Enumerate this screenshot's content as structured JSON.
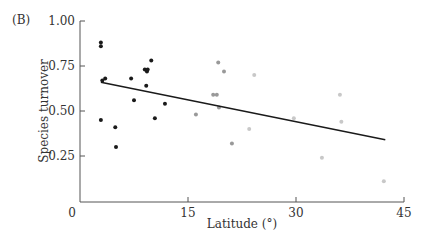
{
  "panel_label": "(B)",
  "chart_data": {
    "type": "scatter",
    "title": "",
    "xlabel": "Latitude (°)",
    "ylabel": "Species turnover",
    "xlim": [
      0,
      45
    ],
    "ylim": [
      0,
      1.0
    ],
    "xticks": [
      "0",
      "15",
      "30",
      "45"
    ],
    "yticks": [
      "0.25",
      "0.50",
      "0.75",
      "1.00"
    ],
    "grid": false,
    "legend": null,
    "series": [
      {
        "name": "tropical",
        "color": "#1a1a1a",
        "points": [
          [
            2.9,
            0.88
          ],
          [
            2.9,
            0.86
          ],
          [
            3.1,
            0.67
          ],
          [
            3.5,
            0.68
          ],
          [
            7.1,
            0.68
          ],
          [
            7.5,
            0.56
          ],
          [
            9.0,
            0.73
          ],
          [
            9.3,
            0.72
          ],
          [
            9.4,
            0.73
          ],
          [
            9.2,
            0.64
          ],
          [
            9.9,
            0.78
          ],
          [
            11.8,
            0.54
          ],
          [
            2.9,
            0.45
          ],
          [
            4.9,
            0.41
          ],
          [
            5.0,
            0.3
          ],
          [
            10.4,
            0.46
          ]
        ]
      },
      {
        "name": "subtropical",
        "color": "#999999",
        "points": [
          [
            19.2,
            0.77
          ],
          [
            20.0,
            0.72
          ],
          [
            18.5,
            0.59
          ],
          [
            19.0,
            0.59
          ],
          [
            19.3,
            0.52
          ],
          [
            16.1,
            0.48
          ],
          [
            21.1,
            0.32
          ]
        ]
      },
      {
        "name": "temperate",
        "color": "#c8c8c8",
        "points": [
          [
            24.2,
            0.7
          ],
          [
            23.5,
            0.4
          ],
          [
            29.7,
            0.46
          ],
          [
            36.1,
            0.59
          ],
          [
            36.3,
            0.44
          ],
          [
            33.6,
            0.24
          ],
          [
            42.2,
            0.11
          ]
        ]
      }
    ],
    "trendline": {
      "x": [
        2.9,
        42.4
      ],
      "y": [
        0.66,
        0.34
      ],
      "color": "#1a1a1a"
    }
  }
}
